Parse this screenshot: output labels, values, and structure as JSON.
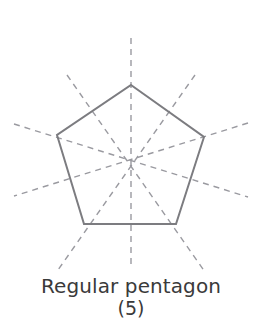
{
  "figure": {
    "name": "regular-pentagon-lines-of-symmetry",
    "background_color": "#ffffff",
    "caption": {
      "title": "Regular pentagon",
      "subtitle": "(5)",
      "text_color": "#3a3a3a",
      "subtitle_clipped": true
    },
    "shape": {
      "name": "regular pentagon",
      "sides": 5,
      "stroke_color": "#7c7c80",
      "stroke_width": 2,
      "fill": "none",
      "center": {
        "x": 131,
        "y": 161
      },
      "circumradius": 77,
      "vertices": [
        {
          "label": "apex",
          "x": 131,
          "y": 85
        },
        {
          "label": "right",
          "x": 204,
          "y": 137
        },
        {
          "label": "bottom-right",
          "x": 176,
          "y": 224
        },
        {
          "label": "bottom-left",
          "x": 84,
          "y": 224
        },
        {
          "label": "left",
          "x": 57,
          "y": 135
        }
      ],
      "points": "131,85 204,137 176,224 84,224 57,135"
    },
    "symmetry": {
      "count": 5,
      "stroke_color": "#9a9aa0",
      "stroke_width": 1.4,
      "dash_pattern": "6 5",
      "axes": [
        {
          "name": "axis-vertical",
          "x1": 131,
          "y1": 38,
          "x2": 131,
          "y2": 268
        },
        {
          "name": "axis-upper-right",
          "x1": 195,
          "y1": 75,
          "x2": 58,
          "y2": 270
        },
        {
          "name": "axis-right",
          "x1": 248,
          "y1": 123,
          "x2": 14,
          "y2": 196
        },
        {
          "name": "axis-left",
          "x1": 14,
          "y1": 124,
          "x2": 248,
          "y2": 197
        },
        {
          "name": "axis-upper-left",
          "x1": 67,
          "y1": 75,
          "x2": 205,
          "y2": 272
        }
      ]
    }
  }
}
